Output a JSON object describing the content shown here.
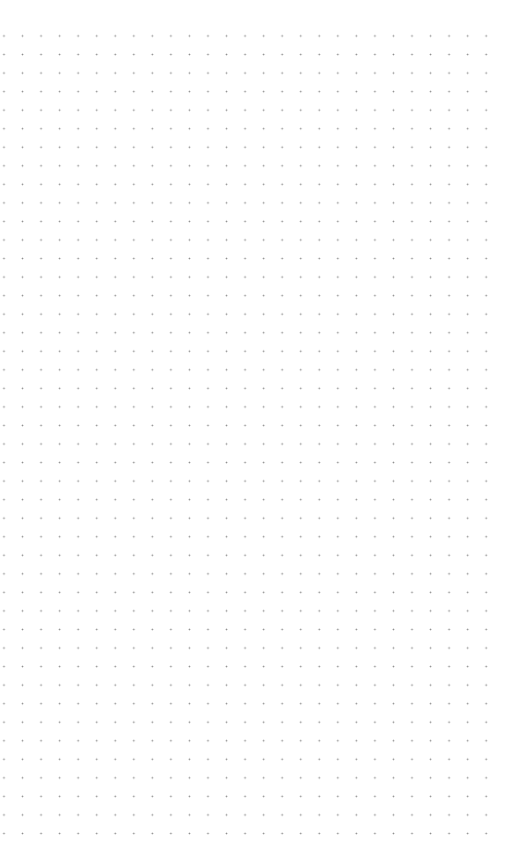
{
  "canvas": {
    "type": "dot-grid",
    "background": "#ffffff",
    "dot_color": "#8a8a8a",
    "spacing_px": 18.56,
    "columns": 27,
    "rows": 44
  }
}
